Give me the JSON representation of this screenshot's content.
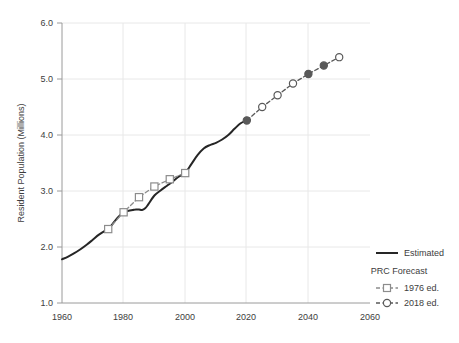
{
  "chart_data": {
    "type": "line",
    "title": "",
    "xlabel": "",
    "ylabel": "Resident Population (Millions)",
    "xlim": [
      1960,
      2060
    ],
    "ylim": [
      1.0,
      6.0
    ],
    "xticks": [
      1960,
      1980,
      2000,
      2020,
      2040,
      2060
    ],
    "yticks": [
      "1.0",
      "2.0",
      "3.0",
      "4.0",
      "5.0",
      "6.0"
    ],
    "grid": true,
    "legend_position": "right",
    "series": [
      {
        "name": "Estimated",
        "style": "solid",
        "color": "#262626",
        "marker": "none",
        "x": [
          1960,
          1962,
          1964,
          1966,
          1968,
          1970,
          1972,
          1974,
          1975,
          1976,
          1978,
          1980,
          1981,
          1982,
          1983,
          1984,
          1985,
          1986,
          1987,
          1988,
          1990,
          1992,
          1994,
          1996,
          1998,
          2000,
          2002,
          2004,
          2006,
          2008,
          2010,
          2012,
          2014,
          2016,
          2018,
          2020,
          2021
        ],
        "y": [
          1.78,
          1.83,
          1.89,
          1.96,
          2.04,
          2.13,
          2.22,
          2.29,
          2.32,
          2.38,
          2.52,
          2.62,
          2.64,
          2.65,
          2.66,
          2.67,
          2.67,
          2.66,
          2.69,
          2.76,
          2.92,
          3.01,
          3.09,
          3.17,
          3.26,
          3.32,
          3.48,
          3.64,
          3.76,
          3.82,
          3.86,
          3.92,
          4.0,
          4.11,
          4.21,
          4.26,
          4.27
        ]
      },
      {
        "name": "1976 ed.",
        "label": "1976 ed.",
        "style": "dashed",
        "color": "#8c8c8c",
        "marker": "square-open",
        "x": [
          1975,
          1980,
          1985,
          1990,
          1995,
          2000
        ],
        "y": [
          2.32,
          2.62,
          2.89,
          3.08,
          3.21,
          3.32
        ]
      },
      {
        "name": "2018 ed.",
        "label": "2018 ed.",
        "style": "dashed",
        "color": "#595959",
        "marker": "circle-mixed",
        "x": [
          2020,
          2025,
          2030,
          2035,
          2040,
          2045,
          2050
        ],
        "y": [
          4.26,
          4.5,
          4.71,
          4.92,
          5.09,
          5.24,
          5.39
        ],
        "filled": [
          true,
          false,
          false,
          false,
          true,
          true,
          false
        ]
      }
    ],
    "legend": {
      "estimated_label": "Estimated",
      "group_label": "PRC Forecast",
      "items": [
        {
          "label": "1976 ed."
        },
        {
          "label": "2018 ed."
        }
      ]
    }
  },
  "colors": {
    "background": "#ffffff",
    "estimated": "#262626",
    "forecast_1976": "#8c8c8c",
    "forecast_2018": "#595959",
    "grid": "#e6e6e6",
    "axis": "#9a9a9a",
    "text": "#3d3d3d"
  }
}
